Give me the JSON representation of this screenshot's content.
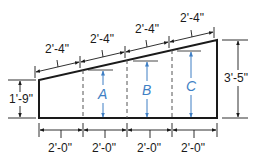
{
  "diagram": {
    "type": "trapezoid-wall-elevation",
    "top_segments": [
      "2'-4\"",
      "2'-4\"",
      "2'-4\"",
      "2'-4\""
    ],
    "bottom_segments": [
      "2'-0\"",
      "2'-0\"",
      "2'-0\"",
      "2'-0\""
    ],
    "left_height": "1'-9\"",
    "right_height": "3'-5\"",
    "unknown_heights": [
      "A",
      "B",
      "C"
    ],
    "colors": {
      "outline": "#1a1a1a",
      "unknown_arrows": "#3f7fc4"
    }
  }
}
